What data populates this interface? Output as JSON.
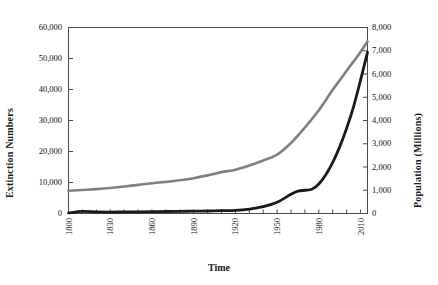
{
  "chart_data": {
    "type": "line",
    "title": "",
    "xlabel": "Time",
    "ylabel": "Extinction Numbers",
    "ylabel_right": "Population (Millions)",
    "xlim": [
      1800,
      2015
    ],
    "ylim": [
      0,
      60000
    ],
    "ylim_right": [
      0,
      8000
    ],
    "grid": false,
    "legend_position": "top-left",
    "x_tick_labels": [
      "1800",
      "1830",
      "1860",
      "1890",
      "1920",
      "1950",
      "1980",
      "2010"
    ],
    "x_tick_values": [
      1800,
      1830,
      1860,
      1890,
      1920,
      1950,
      1980,
      2010
    ],
    "x_minor_tick_interval": 10,
    "y_tick_labels_left": [
      "0",
      "10,000",
      "20,000",
      "30,000",
      "40,000",
      "50,000",
      "60,000"
    ],
    "y_tick_values_left": [
      0,
      10000,
      20000,
      30000,
      40000,
      50000,
      60000
    ],
    "y_tick_labels_right": [
      "0",
      "1,000",
      "2,000",
      "3,000",
      "4,000",
      "5,000",
      "6,000",
      "7,000",
      "8,000"
    ],
    "y_tick_values_right": [
      0,
      1000,
      2000,
      3000,
      4000,
      5000,
      6000,
      7000,
      8000
    ],
    "colors": {
      "extinctions": "#1a1a1a",
      "population": "#808080",
      "axis": "#4a4a4a",
      "background": "#ffffff"
    },
    "series": [
      {
        "name": "Extinctions",
        "axis": "left",
        "color": "#1a1a1a",
        "x": [
          1800,
          1810,
          1820,
          1830,
          1840,
          1850,
          1860,
          1870,
          1880,
          1890,
          1900,
          1910,
          1920,
          1930,
          1940,
          1950,
          1960,
          1965,
          1970,
          1975,
          1980,
          1985,
          1990,
          1995,
          2000,
          2005,
          2010,
          2015
        ],
        "values": [
          200,
          700,
          500,
          450,
          500,
          550,
          600,
          650,
          700,
          750,
          800,
          900,
          1000,
          1400,
          2200,
          3600,
          6200,
          7200,
          7500,
          7800,
          9500,
          12500,
          16500,
          21500,
          27500,
          34500,
          43000,
          52000
        ]
      },
      {
        "name": "Human Population (Millions)",
        "axis": "right",
        "color": "#808080",
        "x": [
          1800,
          1810,
          1820,
          1830,
          1840,
          1850,
          1860,
          1870,
          1880,
          1890,
          1900,
          1910,
          1920,
          1930,
          1940,
          1950,
          1960,
          1970,
          1980,
          1990,
          2000,
          2010,
          2015
        ],
        "values": [
          980,
          1010,
          1050,
          1100,
          1160,
          1230,
          1300,
          1360,
          1430,
          1520,
          1640,
          1780,
          1880,
          2060,
          2280,
          2530,
          3030,
          3700,
          4440,
          5320,
          6140,
          6950,
          7400
        ]
      }
    ]
  },
  "legend": {
    "items": [
      {
        "label": "Extinctions",
        "color": "#1a1a1a"
      },
      {
        "label": "Human Population (Millions)",
        "color": "#808080"
      }
    ]
  }
}
